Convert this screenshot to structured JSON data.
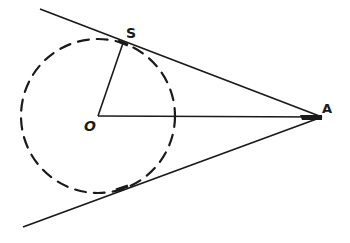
{
  "diagram": {
    "type": "geometry",
    "stroke_color": "#1a1a1a",
    "background": "#ffffff",
    "labels": {
      "S": "S",
      "O": "O",
      "A": "A"
    },
    "points": {
      "O": [
        98,
        116
      ],
      "S": [
        123,
        43
      ],
      "A": [
        322,
        117
      ],
      "T": [
        122,
        188
      ]
    },
    "circle": {
      "cx": 98,
      "cy": 116,
      "r": 77,
      "style": "dashed"
    },
    "lines": {
      "upper_tangent": {
        "from": [
          40,
          9
        ],
        "to": [
          322,
          117
        ]
      },
      "lower_tangent": {
        "from": [
          23,
          227
        ],
        "to": [
          322,
          117
        ]
      },
      "radius_OS": {
        "from": [
          98,
          116
        ],
        "to": [
          123,
          43
        ]
      },
      "line_OA": {
        "from": [
          98,
          116
        ],
        "to": [
          322,
          117
        ]
      }
    }
  }
}
